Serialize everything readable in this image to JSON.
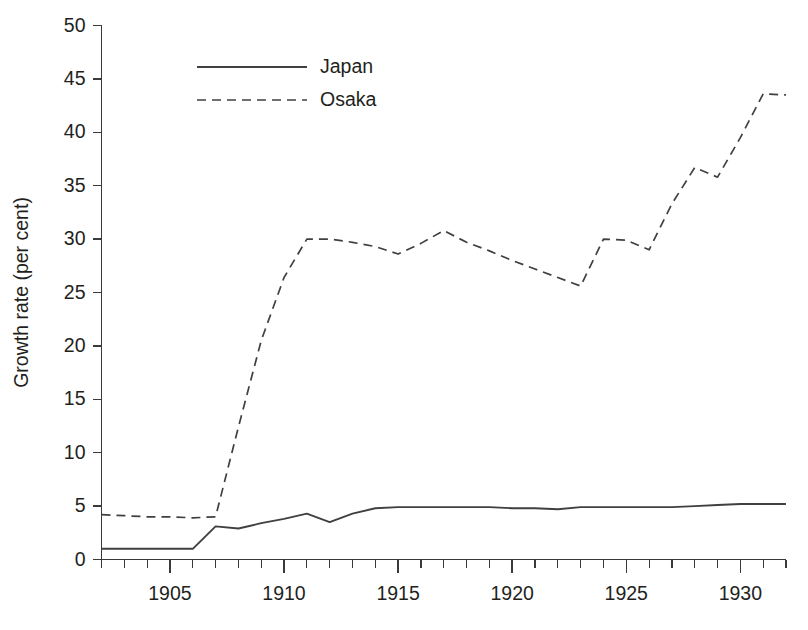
{
  "chart_data": {
    "type": "line",
    "title": "",
    "xlabel": "",
    "ylabel": "Growth rate (per cent)",
    "xlim": [
      1902,
      1932
    ],
    "ylim": [
      0,
      50
    ],
    "grid": false,
    "legend_position": "top-center",
    "y_ticks": [
      0,
      5,
      10,
      15,
      20,
      25,
      30,
      35,
      40,
      45,
      50
    ],
    "y_tick_labels": [
      "0",
      "5",
      "10",
      "15",
      "20",
      "25",
      "30",
      "35",
      "40",
      "45",
      "50"
    ],
    "x_major_ticks": [
      1905,
      1910,
      1915,
      1920,
      1925,
      1930
    ],
    "x_major_tick_labels": [
      "1905",
      "1910",
      "1915",
      "1920",
      "1925",
      "1930"
    ],
    "x_minor_tick_step": 1,
    "x": [
      1902,
      1903,
      1904,
      1905,
      1906,
      1907,
      1908,
      1909,
      1910,
      1911,
      1912,
      1913,
      1914,
      1915,
      1916,
      1917,
      1918,
      1919,
      1920,
      1921,
      1922,
      1923,
      1924,
      1925,
      1926,
      1927,
      1928,
      1929,
      1930,
      1931,
      1932
    ],
    "series": [
      {
        "name": "Japan",
        "style": "solid",
        "color": "#404040",
        "values": [
          1.0,
          1.0,
          1.0,
          1.0,
          1.0,
          3.1,
          2.9,
          3.4,
          3.8,
          4.3,
          3.5,
          4.3,
          4.8,
          4.9,
          4.9,
          4.9,
          4.9,
          4.9,
          4.8,
          4.8,
          4.7,
          4.9,
          4.9,
          4.9,
          4.9,
          4.9,
          5.0,
          5.1,
          5.2,
          5.2,
          5.2
        ]
      },
      {
        "name": "Osaka",
        "style": "dashed",
        "color": "#404040",
        "values": [
          4.2,
          4.1,
          4.0,
          4.0,
          3.9,
          4.0,
          12.4,
          20.5,
          26.4,
          30.0,
          30.0,
          29.7,
          29.3,
          28.6,
          29.6,
          30.8,
          29.7,
          28.9,
          28.0,
          27.2,
          26.4,
          25.6,
          30.0,
          29.9,
          29.0,
          33.3,
          36.7,
          35.8,
          39.5,
          43.6,
          43.5
        ]
      }
    ]
  },
  "legend": {
    "entries": [
      {
        "label": "Japan",
        "style": "solid"
      },
      {
        "label": "Osaka",
        "style": "dashed"
      }
    ]
  }
}
